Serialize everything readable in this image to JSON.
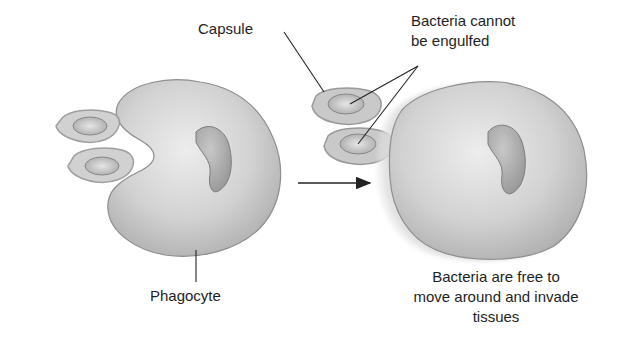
{
  "diagram": {
    "labels": {
      "capsule": "Capsule",
      "cannot_engulf_line1": "Bacteria cannot",
      "cannot_engulf_line2": "be engulfed",
      "phagocyte": "Phagocyte",
      "free_line1": "Bacteria are free to",
      "free_line2": "move around and invade",
      "free_line3": "tissues"
    },
    "colors": {
      "cell_fill": "#c9c9c9",
      "cell_stroke": "#8a8a8a",
      "nucleus_fill": "#a8a8a8",
      "bacteria_fill": "#bdbdbd",
      "capsule_fill": "#d6d6d6",
      "line": "#222222",
      "background": "#ffffff"
    }
  }
}
